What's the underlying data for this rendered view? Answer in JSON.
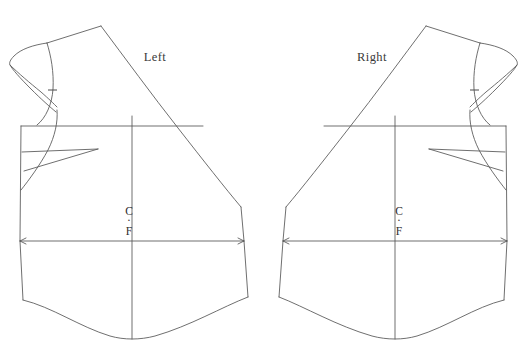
{
  "document": {
    "type": "sewing-pattern-draft",
    "title": "Bodice Front Pattern Pieces",
    "background_color": "#ffffff",
    "line_color": "#555555",
    "text_color": "#2e2e2e",
    "width": 527,
    "height": 354
  },
  "pieces": [
    {
      "id": "left",
      "label": "Left",
      "label_x": 155,
      "label_y": 61,
      "centerfront": {
        "line_1": "C",
        "dot": "·",
        "line_2": "F",
        "x": 129,
        "y_top": 212,
        "y_dot": 222,
        "y_bottom": 232
      },
      "features": [
        "cap-sleeve",
        "shoulder-seam",
        "armhole-curve",
        "armhole-notch",
        "bust-dart",
        "chest-line",
        "waist-line-with-arrows",
        "center-front-grainline",
        "curved-hem",
        "diagonal-wrap-edge"
      ]
    },
    {
      "id": "right",
      "label": "Right",
      "label_x": 372,
      "label_y": 61,
      "centerfront": {
        "line_1": "C",
        "dot": "·",
        "line_2": "F",
        "x": 399,
        "y_top": 212,
        "y_dot": 222,
        "y_bottom": 232
      },
      "features": [
        "cap-sleeve",
        "shoulder-seam",
        "armhole-curve",
        "armhole-notch",
        "bust-dart",
        "chest-line",
        "waist-line-with-arrows",
        "center-front-grainline",
        "curved-hem",
        "diagonal-wrap-edge"
      ]
    }
  ],
  "geometry": {
    "left": {
      "body_outline": "M 20,126 L 20,241 L 22,299 C 60,310 95,336 132,338 C 170,336 210,311 248,297 L 244,241 L 241,209 L 235,207",
      "diagonal_wrap": "M 99,25 C 140,70 175,120 205,160 C 222,183 234,198 241,208",
      "shoulder_top": "M 45,42 L 99,25",
      "shoulder_to_neck": "M 20,126 C 33,118 43,100 49,76 C 52,60 48,48 45,42",
      "armhole_curve": "M 45,42 C 50,55 53,72 52,88 C 51,104 45,118 36,126",
      "cap_outer": "M 45,42 C 32,44 22,48 15,54 C 10,58 8,62 8,64 C 8,68 14,76 24,86 C 34,96 44,104 50,108",
      "cap_inner": "M 15,54 C 22,66 32,80 42,92 C 48,99 52,104 55,107",
      "chest_line": "M 20,126 L 184,126",
      "chest_line_right": "M 184,126 L 205,126",
      "dart_upper": "M 21,152 L 97,149",
      "dart_lower": "M 23,170 L 97,149",
      "waist_line": "M 20,241 L 244,241",
      "center_vertical": "M 132,116 L 132,338",
      "hem_left_tick": "M 22,299 L 20,241",
      "notch_x": 52,
      "notch_y": 89
    }
  },
  "labels": {
    "left_piece": "Left",
    "right_piece": "Right",
    "center_front_top": "C",
    "center_front_dot": "·",
    "center_front_bottom": "F"
  }
}
